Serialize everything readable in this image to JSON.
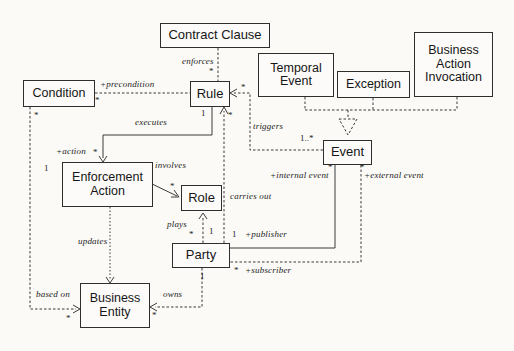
{
  "diagram": {
    "kind": "uml-class-diagram",
    "nodes": {
      "contract_clause": "Contract Clause",
      "temporal_event": "Temporal\nEvent",
      "exception": "Exception",
      "business_action_invocation": "Business\nAction\nInvocation",
      "condition": "Condition",
      "rule": "Rule",
      "event": "Event",
      "enforcement_action": "Enforcement\nAction",
      "role": "Role",
      "party": "Party",
      "business_entity": "Business\nEntity"
    },
    "edge_labels": {
      "enforces": "enforces",
      "precondition": "+precondition",
      "executes": "executes",
      "action": "+action",
      "involves": "involves",
      "triggers": "triggers",
      "carries_out": "carries out",
      "plays": "plays",
      "updates": "updates",
      "based_on": "based on",
      "owns": "owns",
      "publisher": "+publisher",
      "subscriber": "+subscriber",
      "internal_event": "+internal event",
      "external_event": "+external event"
    },
    "multiplicities": {
      "enforces_at_rule": "*",
      "precondition_at_condition": "*",
      "based_on_at_condition": "*",
      "executes_at_rule": "1",
      "action_at_enforcement": "*",
      "enforcement_left": "1",
      "involves_at_role": "*",
      "carries_out_at_rule": "*",
      "triggers_at_rule": "*",
      "triggers_at_event": "1..*",
      "plays_at_party": "1",
      "plays_at_party_left": "*",
      "publisher_at_party": "1",
      "subscriber_at_party": "*",
      "internal_event_at_event": "*",
      "external_event_at_event": "*",
      "owns_at_party": "1",
      "owns_at_entity": "*",
      "based_on_at_entity": "*"
    },
    "line_color": "#3a3a3a"
  }
}
